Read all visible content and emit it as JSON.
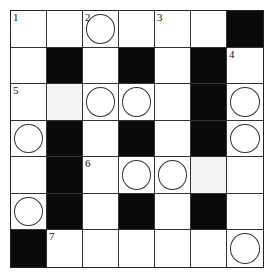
{
  "puzzle": {
    "rows": 7,
    "cols": 7,
    "colors": {
      "black": "#0a0a0a",
      "white": "#ffffff",
      "shade": "#f3f3f3",
      "line": "#333333"
    },
    "cells": [
      [
        {
          "t": "w",
          "n": "1"
        },
        {
          "t": "w"
        },
        {
          "t": "w",
          "n": "2",
          "c": true
        },
        {
          "t": "w"
        },
        {
          "t": "w",
          "n": "3"
        },
        {
          "t": "w"
        },
        {
          "t": "b"
        }
      ],
      [
        {
          "t": "w"
        },
        {
          "t": "b"
        },
        {
          "t": "w"
        },
        {
          "t": "b"
        },
        {
          "t": "w"
        },
        {
          "t": "b"
        },
        {
          "t": "w",
          "n": "4"
        }
      ],
      [
        {
          "t": "w",
          "n": "5"
        },
        {
          "t": "s"
        },
        {
          "t": "w",
          "c": true
        },
        {
          "t": "w",
          "c": true
        },
        {
          "t": "w"
        },
        {
          "t": "b"
        },
        {
          "t": "w",
          "c": true
        }
      ],
      [
        {
          "t": "w",
          "c": true
        },
        {
          "t": "b"
        },
        {
          "t": "w"
        },
        {
          "t": "b"
        },
        {
          "t": "w"
        },
        {
          "t": "b"
        },
        {
          "t": "w",
          "c": true
        }
      ],
      [
        {
          "t": "w"
        },
        {
          "t": "b"
        },
        {
          "t": "w",
          "n": "6"
        },
        {
          "t": "w",
          "c": true
        },
        {
          "t": "w",
          "c": true
        },
        {
          "t": "s"
        },
        {
          "t": "w"
        }
      ],
      [
        {
          "t": "w",
          "c": true
        },
        {
          "t": "b"
        },
        {
          "t": "w"
        },
        {
          "t": "b"
        },
        {
          "t": "w"
        },
        {
          "t": "b"
        },
        {
          "t": "w"
        }
      ],
      [
        {
          "t": "b"
        },
        {
          "t": "w",
          "n": "7"
        },
        {
          "t": "w"
        },
        {
          "t": "w"
        },
        {
          "t": "w"
        },
        {
          "t": "w"
        },
        {
          "t": "w",
          "c": true
        }
      ]
    ]
  }
}
